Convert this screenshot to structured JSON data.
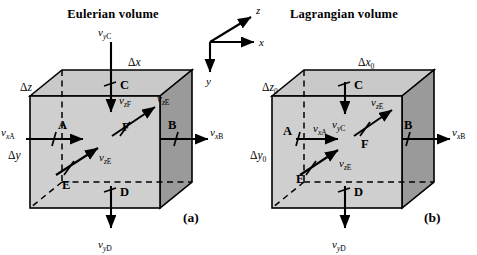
{
  "figure": {
    "panels": [
      {
        "id": "a",
        "title": "Eulerian volume",
        "caption": "(a)",
        "dimensions": {
          "dx": {
            "sym": "Δ",
            "var": "x",
            "sub": ""
          },
          "dy": {
            "sym": "Δ",
            "var": "y",
            "sub": ""
          },
          "dz": {
            "sym": "Δ",
            "var": "z",
            "sub": ""
          }
        },
        "points": [
          "A",
          "B",
          "C",
          "D",
          "E",
          "F"
        ],
        "velocities": [
          {
            "name": "v-xA",
            "v": "v",
            "comp": "x",
            "pt": "A"
          },
          {
            "name": "v-xB",
            "v": "v",
            "comp": "x",
            "pt": "B"
          },
          {
            "name": "v-yC",
            "v": "v",
            "comp": "y",
            "pt": "C"
          },
          {
            "name": "v-yD",
            "v": "v",
            "comp": "y",
            "pt": "D"
          },
          {
            "name": "v-zE",
            "v": "v",
            "comp": "z",
            "pt": "E"
          },
          {
            "name": "v-zF",
            "v": "v",
            "comp": "z",
            "pt": "F"
          },
          {
            "name": "v-zE-face",
            "v": "v",
            "comp": "z",
            "pt": "E"
          }
        ]
      },
      {
        "id": "b",
        "title": "Lagrangian volume",
        "caption": "(b)",
        "dimensions": {
          "dx": {
            "sym": "Δ",
            "var": "x",
            "sub": "0"
          },
          "dy": {
            "sym": "Δ",
            "var": "y",
            "sub": "0"
          },
          "dz": {
            "sym": "Δ",
            "var": "z",
            "sub": "0"
          }
        },
        "points": [
          "A",
          "B",
          "C",
          "D",
          "E",
          "F"
        ],
        "velocities": [
          {
            "name": "v-xA",
            "v": "v",
            "comp": "x",
            "pt": "A"
          },
          {
            "name": "v-xB",
            "v": "v",
            "comp": "x",
            "pt": "B"
          },
          {
            "name": "v-yC",
            "v": "v",
            "comp": "y",
            "pt": "C"
          },
          {
            "name": "v-yD",
            "v": "v",
            "comp": "y",
            "pt": "D"
          },
          {
            "name": "v-zE",
            "v": "v",
            "comp": "z",
            "pt": "E"
          },
          {
            "name": "v-zF",
            "v": "v",
            "comp": "z",
            "pt": "F"
          }
        ]
      }
    ],
    "axes": {
      "x": "x",
      "y": "y",
      "z": "z"
    },
    "colors": {
      "top_face": "#c9c9c9",
      "front_face": "#cfcfcf",
      "right_face": "#9a9a9a",
      "stroke": "#000000",
      "background": "#ffffff"
    }
  }
}
